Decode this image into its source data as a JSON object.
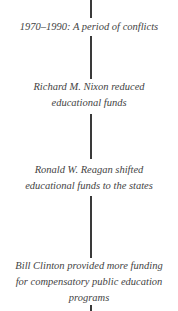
{
  "timeline": {
    "nodes": [
      {
        "lines": [
          "1970–1990: A period of conflicts"
        ]
      },
      {
        "lines": [
          "Richard M. Nixon reduced",
          "educational funds"
        ]
      },
      {
        "lines": [
          "Ronald W. Reagan shifted",
          "educational funds to the states"
        ]
      },
      {
        "lines": [
          "Bill Clinton provided more funding",
          "for compensatory public education",
          "programs"
        ]
      }
    ]
  }
}
